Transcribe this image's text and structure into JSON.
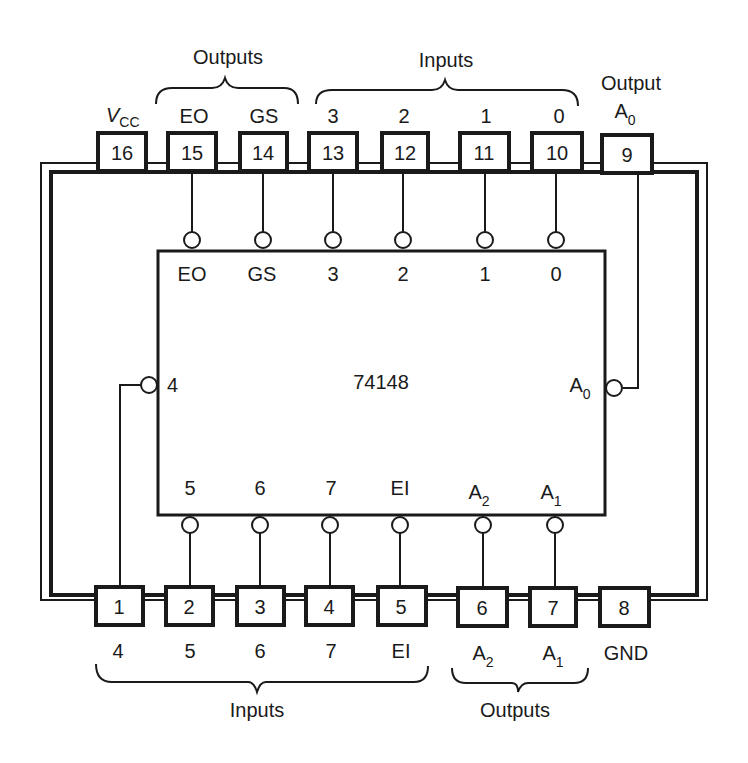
{
  "chip": {
    "name": "74148",
    "colors": {
      "ink": "#1a1a1a",
      "background": "#ffffff"
    }
  },
  "top_groups": {
    "outputs_label": "Outputs",
    "inputs_label": "Inputs",
    "output_label": "Output"
  },
  "bottom_groups": {
    "inputs_label": "Inputs",
    "outputs_label": "Outputs"
  },
  "top_pins": [
    {
      "num": "16",
      "ext_label": "V",
      "ext_sub": "CC"
    },
    {
      "num": "15",
      "ext_label": "EO",
      "int_label": "EO"
    },
    {
      "num": "14",
      "ext_label": "GS",
      "int_label": "GS"
    },
    {
      "num": "13",
      "ext_label": "3",
      "int_label": "3"
    },
    {
      "num": "12",
      "ext_label": "2",
      "int_label": "2"
    },
    {
      "num": "11",
      "ext_label": "1",
      "int_label": "1"
    },
    {
      "num": "10",
      "ext_label": "0",
      "int_label": "0"
    },
    {
      "num": "9",
      "ext_label": "A",
      "ext_sub": "0"
    }
  ],
  "bottom_pins": [
    {
      "num": "1",
      "ext_label": "4"
    },
    {
      "num": "2",
      "ext_label": "5",
      "int_label": "5"
    },
    {
      "num": "3",
      "ext_label": "6",
      "int_label": "6"
    },
    {
      "num": "4",
      "ext_label": "7",
      "int_label": "7"
    },
    {
      "num": "5",
      "ext_label": "EI",
      "int_label": "EI"
    },
    {
      "num": "6",
      "ext_label": "A",
      "ext_sub": "2",
      "int_label": "A",
      "int_sub": "2"
    },
    {
      "num": "7",
      "ext_label": "A",
      "ext_sub": "1",
      "int_label": "A",
      "int_sub": "1"
    },
    {
      "num": "8",
      "ext_label": "GND"
    }
  ],
  "side_pins": {
    "left_label": "4",
    "right_label": "A",
    "right_sub": "0"
  }
}
